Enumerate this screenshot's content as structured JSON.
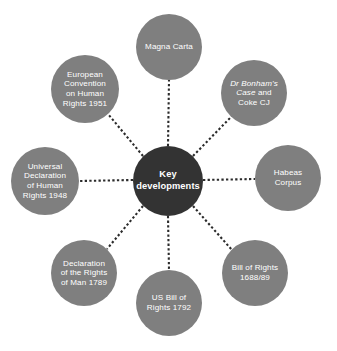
{
  "diagram": {
    "type": "radial-hub-and-spoke",
    "title_node": "Key developments",
    "canvas": {
      "width": 337,
      "height": 351
    },
    "colors": {
      "background": "#ffffff",
      "center_fill": "#333333",
      "satellite_fill": "#7f7f7f",
      "label_text": "#ffffff",
      "connector": "#2b2b2b"
    },
    "center": {
      "label": "Key developments",
      "cx": 168,
      "cy": 181,
      "r": 35
    },
    "nodes": [
      {
        "id": "magna-carta",
        "label": "Magna Carta",
        "cx": 169,
        "cy": 47,
        "r": 33,
        "italic_lead": "",
        "rest": ""
      },
      {
        "id": "dr-bonhams-case",
        "label": "Dr Bonham's Case and Coke CJ",
        "cx": 254,
        "cy": 93,
        "r": 33,
        "italic_lead": "Dr Bonham's\nCase",
        "rest": " and\nCoke CJ"
      },
      {
        "id": "habeas-corpus",
        "label": "Habeas\nCorpus",
        "cx": 288,
        "cy": 178,
        "r": 33,
        "italic_lead": "",
        "rest": ""
      },
      {
        "id": "bill-of-rights-1688",
        "label": "Bill of Rights\n1688/89",
        "cx": 255,
        "cy": 273,
        "r": 33,
        "italic_lead": "",
        "rest": ""
      },
      {
        "id": "us-bill-of-rights-1792",
        "label": "US Bill of\nRights 1792",
        "cx": 169,
        "cy": 303,
        "r": 33,
        "italic_lead": "",
        "rest": ""
      },
      {
        "id": "declaration-rights-of-man-1789",
        "label": "Declaration\nof the Rights\nof Man 1789",
        "cx": 84,
        "cy": 273,
        "r": 33,
        "italic_lead": "",
        "rest": ""
      },
      {
        "id": "universal-declaration-human-rights-1948",
        "label": "Universal\nDeclaration\nof Human\nRights 1948",
        "cx": 45,
        "cy": 181,
        "r": 34,
        "italic_lead": "",
        "rest": ""
      },
      {
        "id": "european-convention-human-rights-1951",
        "label": "European\nConvention\non Human\nRights 1951",
        "cx": 85,
        "cy": 89,
        "r": 34,
        "italic_lead": "",
        "rest": ""
      }
    ],
    "connectors": [
      {
        "id": "spoke-magna-carta",
        "x1": 168,
        "y1": 146,
        "x2": 169,
        "y2": 80
      },
      {
        "id": "spoke-dr-bonhams-case",
        "x1": 193,
        "y1": 156,
        "x2": 231,
        "y2": 117
      },
      {
        "id": "spoke-habeas-corpus",
        "x1": 203,
        "y1": 180,
        "x2": 255,
        "y2": 179
      },
      {
        "id": "spoke-bill-of-rights",
        "x1": 193,
        "y1": 206,
        "x2": 232,
        "y2": 250
      },
      {
        "id": "spoke-us-bill-of-rights",
        "x1": 168,
        "y1": 216,
        "x2": 169,
        "y2": 270
      },
      {
        "id": "spoke-declaration-man",
        "x1": 143,
        "y1": 206,
        "x2": 107,
        "y2": 249
      },
      {
        "id": "spoke-universal-decl",
        "x1": 133,
        "y1": 180,
        "x2": 79,
        "y2": 181
      },
      {
        "id": "spoke-european-convention",
        "x1": 143,
        "y1": 156,
        "x2": 108,
        "y2": 114
      }
    ]
  }
}
